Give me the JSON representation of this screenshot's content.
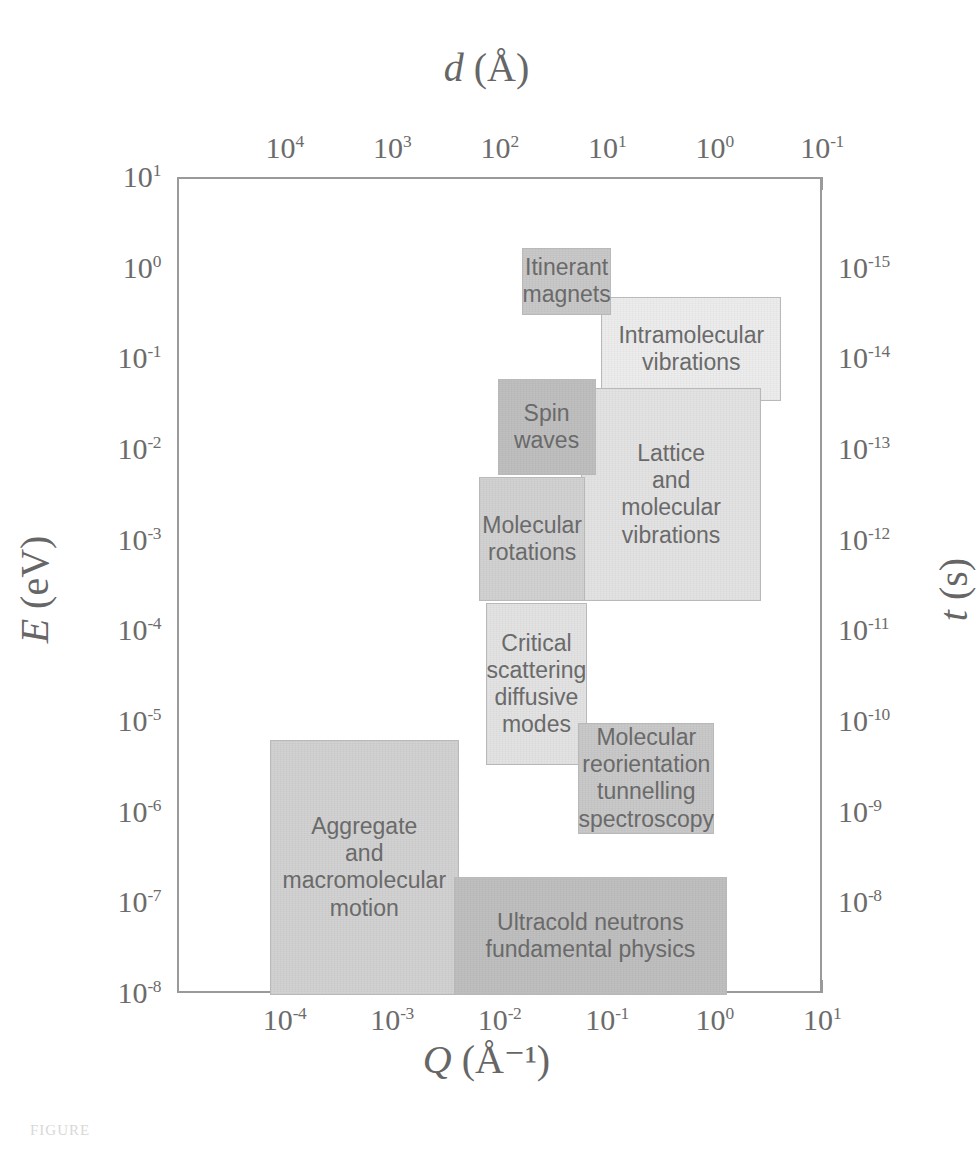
{
  "axes": {
    "top": {
      "title_italic": "d",
      "title_rest": " (Å)",
      "labels": [
        "10⁴",
        "10³",
        "10²",
        "10¹",
        "10⁰",
        "10⁻¹"
      ],
      "exponents": [
        "4",
        "3",
        "2",
        "1",
        "0",
        "-1"
      ],
      "range": [
        100000,
        0.1
      ]
    },
    "bottom": {
      "title_italic": "Q",
      "title_rest": " (Å⁻¹)",
      "exponents": [
        "-4",
        "-3",
        "-2",
        "-1",
        "0",
        "1"
      ],
      "range": [
        1e-05,
        10
      ]
    },
    "left": {
      "title_italic": "E",
      "title_rest": " (eV)",
      "exponents": [
        "1",
        "0",
        "-1",
        "-2",
        "-3",
        "-4",
        "-5",
        "-6",
        "-7",
        "-8"
      ],
      "range": [
        1e-08,
        10
      ]
    },
    "right": {
      "title_italic": "t",
      "title_rest": " (s)",
      "exponents": [
        "-15",
        "-14",
        "-13",
        "-12",
        "-11",
        "-10",
        "-9",
        "-8"
      ],
      "range": [
        1e-15,
        1e-08
      ]
    }
  },
  "chart_data": {
    "type": "area",
    "title": "",
    "xlabel": "Q (Å⁻¹)",
    "ylabel": "E (eV)",
    "xlabel_top": "d (Å)",
    "ylabel_right": "t (s)",
    "xscale": "log",
    "yscale": "log",
    "xlim": [
      1e-05,
      10
    ],
    "ylim": [
      1e-08,
      10
    ],
    "xlim_top": [
      100000,
      0.1
    ],
    "ylim_right": [
      1e-15,
      1e-08
    ],
    "grid": false,
    "legend": "none",
    "note": "Map of neutron scattering dynamic range: labelled rectangular regions in (Q,E) space.",
    "regions": [
      {
        "label": "Itinerant magnets",
        "lines": [
          "Itinerant",
          "magnets"
        ],
        "q_range": [
          0.0155,
          0.105
        ],
        "e_range": [
          0.32,
          1.75
        ],
        "tone": "tone-5"
      },
      {
        "label": "Intramolecular vibrations",
        "lines": [
          "Intramolecular",
          "vibrations"
        ],
        "q_range": [
          0.085,
          4.0
        ],
        "e_range": [
          0.036,
          0.5
        ],
        "tone": "tone-1"
      },
      {
        "label": "Spin waves",
        "lines": [
          "Spin",
          "waves"
        ],
        "q_range": [
          0.0092,
          0.075
        ],
        "e_range": [
          0.0055,
          0.062
        ],
        "tone": "tone-6"
      },
      {
        "label": "Lattice and molecular vibrations",
        "lines": [
          "Lattice",
          "and",
          "molecular",
          "vibrations"
        ],
        "q_range": [
          0.055,
          2.6
        ],
        "e_range": [
          0.00022,
          0.05
        ],
        "tone": "tone-2"
      },
      {
        "label": "Molecular rotations",
        "lines": [
          "Molecular",
          "rotations"
        ],
        "q_range": [
          0.0062,
          0.06
        ],
        "e_range": [
          0.00022,
          0.0052
        ],
        "tone": "tone-4"
      },
      {
        "label": "Critical scattering diffusive modes",
        "lines": [
          "Critical",
          "scattering",
          "diffusive",
          "modes"
        ],
        "q_range": [
          0.0072,
          0.062
        ],
        "e_range": [
          3.4e-06,
          0.00021
        ],
        "tone": "tone-2"
      },
      {
        "label": "Molecular reorientation tunnelling spectroscopy",
        "lines": [
          "Molecular",
          "reorientation",
          "tunnelling",
          "spectroscopy"
        ],
        "q_range": [
          0.052,
          0.95
        ],
        "e_range": [
          6e-07,
          1e-05
        ],
        "tone": "tone-5"
      },
      {
        "label": "Aggregate and macromolecular motion",
        "lines": [
          "Aggregate",
          "and",
          "macromolecular",
          "motion"
        ],
        "q_range": [
          7e-05,
          0.004
        ],
        "e_range": [
          1e-08,
          6.5e-06
        ],
        "tone": "tone-4"
      },
      {
        "label": "Ultracold neutrons fundamental physics",
        "lines": [
          "Ultracold neutrons",
          "fundamental physics"
        ],
        "q_range": [
          0.0036,
          1.25
        ],
        "e_range": [
          1e-08,
          2e-07
        ],
        "tone": "tone-6"
      }
    ]
  },
  "caption": {
    "fragment": "FIGURE"
  }
}
